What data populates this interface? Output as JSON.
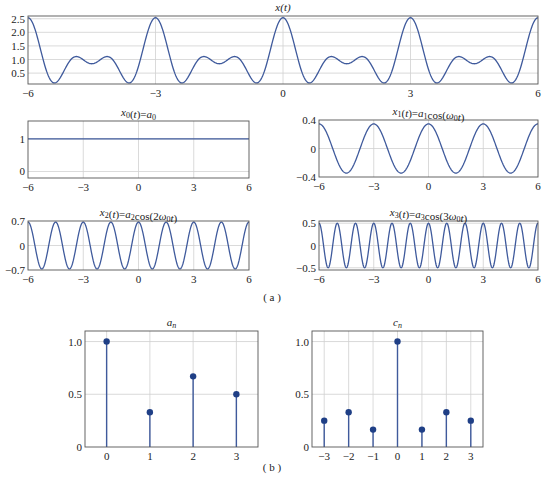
{
  "figure": {
    "caption_a": "( a )",
    "caption_b": "( b )",
    "line_color": "#3f5a9c",
    "stem_color": "#3f5a9c",
    "marker_color": "#1f3f86",
    "grid_color": "#d0d0d0",
    "axis_color": "#555555"
  },
  "chart_data": [
    {
      "id": "x_t",
      "type": "line",
      "title": "x(t)",
      "title_html": "x(t)",
      "xlabel": "",
      "ylabel": "",
      "xlim": [
        -6,
        6
      ],
      "ylim": [
        0.1,
        2.6
      ],
      "xticks": [
        -6,
        -3,
        0,
        3,
        6
      ],
      "xtick_labels": [
        "−6",
        "−3",
        "0",
        "3",
        "6"
      ],
      "yticks": [
        0.5,
        1.0,
        1.5,
        2.0,
        2.5
      ],
      "ytick_labels": [
        "0.5",
        "1.0",
        "1.5",
        "2.0",
        "2.5"
      ],
      "grid": true,
      "xgrid": [
        -3,
        0,
        3
      ],
      "formula": {
        "a0": 1.0,
        "harmonics": [
          [
            1,
            0.345
          ],
          [
            2,
            0.69
          ],
          [
            3,
            0.5
          ]
        ],
        "period": 3
      },
      "box": [
        28,
        16,
        538,
        84
      ]
    },
    {
      "id": "x0_t",
      "type": "line",
      "title": "x0(t)=a0",
      "title_parts": [
        [
          "x",
          "i"
        ],
        [
          "0",
          "sub"
        ],
        [
          "(",
          ""
        ],
        [
          "t",
          "i"
        ],
        [
          ")=",
          ""
        ],
        [
          "a",
          "i"
        ],
        [
          "0",
          "sub"
        ]
      ],
      "xlim": [
        -6,
        6
      ],
      "ylim": [
        -0.2,
        1.55
      ],
      "xticks": [
        -6,
        -3,
        0,
        3,
        6
      ],
      "xtick_labels": [
        "−6",
        "−3",
        "0",
        "3",
        "6"
      ],
      "yticks": [
        0,
        1
      ],
      "ytick_labels": [
        "0",
        "1"
      ],
      "grid": true,
      "xgrid": [
        -3,
        0,
        3
      ],
      "formula": {
        "a0": 1.0,
        "harmonics": [],
        "period": 3
      },
      "box": [
        28,
        121,
        249,
        178
      ]
    },
    {
      "id": "x1_t",
      "type": "line",
      "title": "x1(t)=a1cos(ω0t)",
      "title_parts": [
        [
          "x",
          "i"
        ],
        [
          "1",
          "sub"
        ],
        [
          "(",
          ""
        ],
        [
          "t",
          "i"
        ],
        [
          ")=",
          ""
        ],
        [
          "a",
          "i"
        ],
        [
          "1",
          "sub"
        ],
        [
          "cos(",
          ""
        ],
        [
          "ω",
          "i"
        ],
        [
          "0",
          "sub"
        ],
        [
          "t",
          "i"
        ],
        [
          ")",
          ""
        ]
      ],
      "xlim": [
        -6,
        6
      ],
      "ylim": [
        -0.4,
        0.4
      ],
      "xticks": [
        -6,
        -3,
        0,
        3,
        6
      ],
      "xtick_labels": [
        "−6",
        "−3",
        "0",
        "3",
        "6"
      ],
      "yticks": [
        -0.4,
        0,
        0.4
      ],
      "ytick_labels": [
        "−0.4",
        "0",
        "0.4"
      ],
      "grid": true,
      "xgrid": [
        -3,
        0,
        3
      ],
      "formula": {
        "a0": 0,
        "harmonics": [
          [
            1,
            0.345
          ]
        ],
        "period": 3
      },
      "box": [
        319,
        120,
        538,
        177
      ]
    },
    {
      "id": "x2_t",
      "type": "line",
      "title": "x2(t)=a2cos(2ω0t)",
      "title_parts": [
        [
          "x",
          "i"
        ],
        [
          "2",
          "sub"
        ],
        [
          "(",
          ""
        ],
        [
          "t",
          "i"
        ],
        [
          ")=",
          ""
        ],
        [
          "a",
          "i"
        ],
        [
          "2",
          "sub"
        ],
        [
          "cos(2",
          ""
        ],
        [
          "ω",
          "i"
        ],
        [
          "0",
          "sub"
        ],
        [
          "t",
          "i"
        ],
        [
          ")",
          ""
        ]
      ],
      "xlim": [
        -6,
        6
      ],
      "ylim": [
        -0.7,
        0.7
      ],
      "xticks": [
        -6,
        -3,
        0,
        3,
        6
      ],
      "xtick_labels": [
        "−6",
        "−3",
        "0",
        "3",
        "6"
      ],
      "yticks": [
        -0.7,
        0,
        0.7
      ],
      "ytick_labels": [
        "−0.7",
        "0",
        "0.7"
      ],
      "grid": true,
      "xgrid": [
        -3,
        0,
        3
      ],
      "formula": {
        "a0": 0,
        "harmonics": [
          [
            2,
            0.67
          ]
        ],
        "period": 3
      },
      "box": [
        28,
        221,
        249,
        270
      ]
    },
    {
      "id": "x3_t",
      "type": "line",
      "title": "x3(t)=a3cos(3ω0t)",
      "title_parts": [
        [
          "x",
          "i"
        ],
        [
          "3",
          "sub"
        ],
        [
          "(",
          ""
        ],
        [
          "t",
          "i"
        ],
        [
          ")=",
          ""
        ],
        [
          "a",
          "i"
        ],
        [
          "3",
          "sub"
        ],
        [
          "cos(3",
          ""
        ],
        [
          "ω",
          "i"
        ],
        [
          "0",
          "sub"
        ],
        [
          "t",
          "i"
        ],
        [
          ")",
          ""
        ]
      ],
      "xlim": [
        -6,
        6
      ],
      "ylim": [
        -0.55,
        0.55
      ],
      "xticks": [
        -6,
        -3,
        0,
        3,
        6
      ],
      "xtick_labels": [
        "−6",
        "−3",
        "0",
        "3",
        "6"
      ],
      "yticks": [
        -0.5,
        0,
        0.5
      ],
      "ytick_labels": [
        "−0.5",
        "0",
        "0.5"
      ],
      "grid": true,
      "xgrid": [
        -3,
        0,
        3
      ],
      "formula": {
        "a0": 0,
        "harmonics": [
          [
            3,
            0.5
          ]
        ],
        "period": 3
      },
      "box": [
        319,
        221,
        538,
        270
      ]
    },
    {
      "id": "a_n",
      "type": "stem",
      "title": "a_n",
      "title_parts": [
        [
          "a",
          "i"
        ],
        [
          "n",
          "sub-i"
        ]
      ],
      "categories": [
        0,
        1,
        2,
        3
      ],
      "xtick_labels": [
        "0",
        "1",
        "2",
        "3"
      ],
      "values": [
        1.0,
        0.33,
        0.67,
        0.5
      ],
      "xlim": [
        -0.5,
        3.5
      ],
      "ylim": [
        0,
        1.1
      ],
      "yticks": [
        0,
        0.5,
        1.0
      ],
      "ytick_labels": [
        "0",
        "0.5",
        "1.0"
      ],
      "grid": true,
      "box": [
        85,
        331,
        258,
        447
      ]
    },
    {
      "id": "c_n",
      "type": "stem",
      "title": "c_n",
      "title_parts": [
        [
          "c",
          "i"
        ],
        [
          "n",
          "sub-i"
        ]
      ],
      "categories": [
        -3,
        -2,
        -1,
        0,
        1,
        2,
        3
      ],
      "xtick_labels": [
        "−3",
        "−2",
        "−1",
        "0",
        "1",
        "2",
        "3"
      ],
      "values": [
        0.25,
        0.33,
        0.165,
        1.0,
        0.165,
        0.33,
        0.25
      ],
      "xlim": [
        -3.5,
        3.5
      ],
      "ylim": [
        0,
        1.1
      ],
      "yticks": [
        0,
        0.5,
        1.0
      ],
      "ytick_labels": [
        "0",
        "0.5",
        "1.0"
      ],
      "grid": true,
      "box": [
        312,
        331,
        483,
        447
      ]
    }
  ]
}
